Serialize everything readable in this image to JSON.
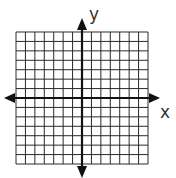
{
  "diagram": {
    "type": "coordinate-plane",
    "grid": {
      "columns": 14,
      "rows": 14,
      "left": 16,
      "top": 32,
      "size": 132
    },
    "axes": {
      "x_label": "x",
      "y_label": "y",
      "origin_col": 7,
      "origin_row": 7
    },
    "colors": {
      "grid": "#2a2a2a",
      "axis": "#111111",
      "background": "#ffffff"
    }
  }
}
